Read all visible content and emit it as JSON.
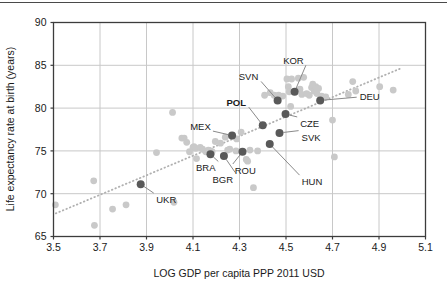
{
  "chart_data": {
    "type": "scatter",
    "title": "",
    "xlabel": "LOG GDP per capita PPP 2011 USD",
    "ylabel": "Life expectancy rate at birth (years)",
    "xlim": [
      3.5,
      5.1
    ],
    "ylim": [
      65,
      90
    ],
    "xticks": [
      "3.5",
      "3.7",
      "3.9",
      "4.1",
      "4.3",
      "4.5",
      "4.7",
      "4.9",
      "5.1"
    ],
    "yticks": [
      "65",
      "70",
      "75",
      "80",
      "85",
      "90"
    ],
    "grid": true,
    "legend": "none",
    "colors": {
      "background": "#ffffff",
      "axis": "#3c3c3c",
      "grid": "#c8c8c8",
      "point_default": "#c9c9c9",
      "point_highlight": "#595959",
      "trendline": "#b0b0b0",
      "leader": "#8a8a8a",
      "text": "#1a1a1a"
    },
    "trendline": {
      "type": "dotted-linear",
      "x_start": 3.51,
      "y_start": 67.7,
      "x_end": 4.99,
      "y_end": 84.6
    },
    "highlighted_points": [
      {
        "code": "UKR",
        "x": 3.875,
        "y": 71.1,
        "label_x": 3.985,
        "label_y": 68.9,
        "bold": false
      },
      {
        "code": "BRA",
        "x": 4.175,
        "y": 74.6,
        "label_x": 4.155,
        "label_y": 72.6,
        "bold": false
      },
      {
        "code": "BGR",
        "x": 4.233,
        "y": 74.4,
        "label_x": 4.228,
        "label_y": 71.3,
        "bold": false
      },
      {
        "code": "MEX",
        "x": 4.268,
        "y": 76.8,
        "label_x": 4.132,
        "label_y": 77.5,
        "bold": false
      },
      {
        "code": "ROU",
        "x": 4.313,
        "y": 74.9,
        "label_x": 4.325,
        "label_y": 72.3,
        "bold": false
      },
      {
        "code": "POL",
        "x": 4.4,
        "y": 78.0,
        "label_x": 4.286,
        "label_y": 80.3,
        "bold": true
      },
      {
        "code": "HUN",
        "x": 4.43,
        "y": 75.8,
        "label_x": 4.612,
        "label_y": 71.0,
        "bold": false
      },
      {
        "code": "SVN",
        "x": 4.464,
        "y": 80.9,
        "label_x": 4.339,
        "label_y": 83.3,
        "bold": false
      },
      {
        "code": "SVK",
        "x": 4.472,
        "y": 77.1,
        "label_x": 4.608,
        "label_y": 76.2,
        "bold": false
      },
      {
        "code": "CZE",
        "x": 4.498,
        "y": 79.3,
        "label_x": 4.602,
        "label_y": 77.8,
        "bold": false
      },
      {
        "code": "KOR",
        "x": 4.537,
        "y": 81.9,
        "label_x": 4.532,
        "label_y": 85.2,
        "bold": false
      },
      {
        "code": "DEU",
        "x": 4.647,
        "y": 80.9,
        "label_x": 4.86,
        "label_y": 80.9,
        "bold": false
      }
    ],
    "background_points": [
      {
        "x": 3.508,
        "y": 68.7
      },
      {
        "x": 3.673,
        "y": 71.5
      },
      {
        "x": 3.676,
        "y": 66.3
      },
      {
        "x": 3.754,
        "y": 68.2
      },
      {
        "x": 3.812,
        "y": 68.7
      },
      {
        "x": 3.943,
        "y": 74.8
      },
      {
        "x": 4.012,
        "y": 79.5
      },
      {
        "x": 4.018,
        "y": 69.0
      },
      {
        "x": 4.052,
        "y": 76.5
      },
      {
        "x": 4.062,
        "y": 76.5
      },
      {
        "x": 4.073,
        "y": 76.0
      },
      {
        "x": 4.085,
        "y": 74.9
      },
      {
        "x": 4.1,
        "y": 75.4
      },
      {
        "x": 4.104,
        "y": 75.5
      },
      {
        "x": 4.112,
        "y": 75.3
      },
      {
        "x": 4.115,
        "y": 74.1
      },
      {
        "x": 4.131,
        "y": 75.4
      },
      {
        "x": 4.141,
        "y": 75.2
      },
      {
        "x": 4.155,
        "y": 74.9
      },
      {
        "x": 4.166,
        "y": 75.1
      },
      {
        "x": 4.175,
        "y": 75.0
      },
      {
        "x": 4.182,
        "y": 74.9
      },
      {
        "x": 4.196,
        "y": 76.1
      },
      {
        "x": 4.218,
        "y": 75.9
      },
      {
        "x": 4.239,
        "y": 76.6
      },
      {
        "x": 4.249,
        "y": 75.1
      },
      {
        "x": 4.258,
        "y": 75.2
      },
      {
        "x": 4.285,
        "y": 75.0
      },
      {
        "x": 4.288,
        "y": 76.4
      },
      {
        "x": 4.307,
        "y": 77.2
      },
      {
        "x": 4.329,
        "y": 74.0
      },
      {
        "x": 4.335,
        "y": 73.8
      },
      {
        "x": 4.345,
        "y": 75.1
      },
      {
        "x": 4.36,
        "y": 70.7
      },
      {
        "x": 4.378,
        "y": 75.0
      },
      {
        "x": 4.408,
        "y": 81.5
      },
      {
        "x": 4.432,
        "y": 81.8
      },
      {
        "x": 4.449,
        "y": 81.5
      },
      {
        "x": 4.468,
        "y": 81.5
      },
      {
        "x": 4.486,
        "y": 81.4
      },
      {
        "x": 4.504,
        "y": 83.4
      },
      {
        "x": 4.51,
        "y": 82.5
      },
      {
        "x": 4.514,
        "y": 81.9
      },
      {
        "x": 4.52,
        "y": 80.2
      },
      {
        "x": 4.524,
        "y": 83.4
      },
      {
        "x": 4.553,
        "y": 83.5
      },
      {
        "x": 4.56,
        "y": 82.2
      },
      {
        "x": 4.568,
        "y": 81.6
      },
      {
        "x": 4.576,
        "y": 83.6
      },
      {
        "x": 4.589,
        "y": 81.7
      },
      {
        "x": 4.6,
        "y": 81.5
      },
      {
        "x": 4.61,
        "y": 82.4
      },
      {
        "x": 4.615,
        "y": 82.8
      },
      {
        "x": 4.621,
        "y": 82.0
      },
      {
        "x": 4.628,
        "y": 82.5
      },
      {
        "x": 4.633,
        "y": 81.7
      },
      {
        "x": 4.64,
        "y": 82.3
      },
      {
        "x": 4.653,
        "y": 81.4
      },
      {
        "x": 4.671,
        "y": 81.3
      },
      {
        "x": 4.7,
        "y": 78.6
      },
      {
        "x": 4.708,
        "y": 74.3
      },
      {
        "x": 4.768,
        "y": 81.6
      },
      {
        "x": 4.787,
        "y": 83.1
      },
      {
        "x": 4.8,
        "y": 82.0
      },
      {
        "x": 4.903,
        "y": 82.5
      },
      {
        "x": 4.961,
        "y": 82.1
      }
    ]
  }
}
